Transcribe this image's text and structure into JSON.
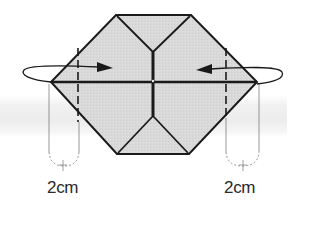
{
  "diagram": {
    "type": "origami-fold-instruction",
    "shape": "hexagon",
    "fill_color": "#d9d9d9",
    "line_color": "#1a1a1a",
    "background_band_color": "#ececec",
    "instructions": {
      "left_fold": {
        "direction": "fold-right-behind",
        "arrow": "arrow-right"
      },
      "right_fold": {
        "direction": "fold-left-behind",
        "arrow": "arrow-left"
      }
    },
    "measurements": {
      "left": {
        "label": "2cm"
      },
      "right": {
        "label": "2cm"
      }
    }
  }
}
